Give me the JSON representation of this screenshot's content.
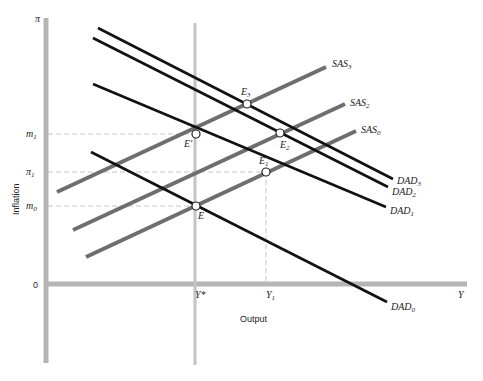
{
  "diagram": {
    "x_axis": {
      "label": "Output",
      "end_label": "Y",
      "origin_label": "0",
      "ticks": [
        {
          "label": "Y*",
          "x": 195
        },
        {
          "label": "Y",
          "sub": "1",
          "x": 266
        }
      ]
    },
    "y_axis": {
      "label": "Inflation",
      "top_label": "π",
      "ticks": [
        {
          "label": "m",
          "sub": "1",
          "y": 134
        },
        {
          "label": "π",
          "sub": "1",
          "y": 172
        },
        {
          "label": "m",
          "sub": "0",
          "y": 206
        }
      ]
    },
    "curves": {
      "dad": [
        {
          "name": "DAD",
          "sub": "3",
          "x1": 98,
          "y1": 28,
          "x2": 393,
          "y2": 179,
          "lx": 397,
          "ly": 184
        },
        {
          "name": "DAD",
          "sub": "2",
          "x1": 93,
          "y1": 38,
          "x2": 388,
          "y2": 187,
          "lx": 392,
          "ly": 195
        },
        {
          "name": "DAD",
          "sub": "1",
          "x1": 93,
          "y1": 84,
          "x2": 386,
          "y2": 207,
          "lx": 390,
          "ly": 214
        },
        {
          "name": "DAD",
          "sub": "0",
          "x1": 91,
          "y1": 152,
          "x2": 387,
          "y2": 302,
          "lx": 391,
          "ly": 310
        }
      ],
      "sas": [
        {
          "name": "SAS",
          "sub": "3",
          "x1": 57,
          "y1": 192,
          "x2": 326,
          "y2": 67,
          "lx": 332,
          "ly": 67
        },
        {
          "name": "SAS",
          "sub": "2",
          "x1": 73,
          "y1": 230,
          "x2": 345,
          "y2": 104,
          "lx": 350,
          "ly": 106
        },
        {
          "name": "SAS",
          "sub": "0",
          "x1": 86,
          "y1": 257,
          "x2": 356,
          "y2": 131,
          "lx": 361,
          "ly": 133
        }
      ]
    },
    "points": [
      {
        "name": "E",
        "sub": "",
        "x": 196,
        "y": 206,
        "lx": 198,
        "ly": 219
      },
      {
        "name": "E'",
        "sub": "",
        "x": 196,
        "y": 134,
        "lx": 184,
        "ly": 147
      },
      {
        "name": "E",
        "sub": "1",
        "x": 266,
        "y": 172,
        "lx": 259,
        "ly": 164
      },
      {
        "name": "E",
        "sub": "2",
        "x": 280,
        "y": 133,
        "lx": 280,
        "ly": 148
      },
      {
        "name": "E",
        "sub": "3",
        "x": 247,
        "y": 104,
        "lx": 241,
        "ly": 95
      }
    ],
    "colors": {
      "axis": "#b5b5b5",
      "dad": "#111111",
      "sas": "#6e6e6e",
      "guide": "#c4c4c4"
    }
  }
}
